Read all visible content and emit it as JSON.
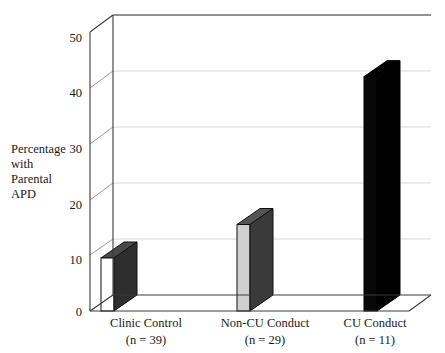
{
  "chart_data": {
    "type": "bar",
    "title": "",
    "subtitle": "",
    "xlabel": "",
    "ylabel": "Percentage with Parental APD",
    "ylabel_lines": [
      "Percentage",
      "with",
      "Parental",
      "APD"
    ],
    "categories": [
      "Clinic Control",
      "Non-CU Conduct",
      "CU Conduct"
    ],
    "category_sublabels": [
      "(n = 39)",
      "(n = 29)",
      "(n = 11)"
    ],
    "values": [
      9.5,
      15.5,
      42
    ],
    "ylim": [
      0,
      50
    ],
    "yticks": [
      0,
      10,
      20,
      30,
      40,
      50
    ],
    "ytick_labels": [
      "0",
      "10",
      "20",
      "30",
      "40",
      "50"
    ],
    "grid": true,
    "grid_axis": "y",
    "legend": "none",
    "style": "3d-column",
    "bar_colors": [
      "#ffffff",
      "#d0d0d0",
      "#080808"
    ],
    "bar_side_colors": [
      "#2e2e2e",
      "#3a3a3a",
      "#000000"
    ],
    "bar_top_colors": [
      "#4a4a4a",
      "#555555",
      "#000000"
    ],
    "axis_color": "#3a3a3a",
    "grid_color": "#d8d8d8"
  }
}
